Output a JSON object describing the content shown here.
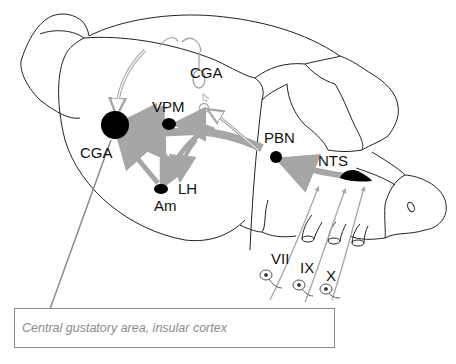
{
  "diagram": {
    "labels": {
      "cga_top": "CGA",
      "cga_main": "CGA",
      "vpm": "VPM",
      "pbn": "PBN",
      "nts": "NTS",
      "lh": "LH",
      "am": "Am",
      "nerve_vii": "VII",
      "nerve_ix": "IX",
      "nerve_x": "X"
    },
    "caption": "Central gustatory area, insular cortex",
    "colors": {
      "outline": "#222222",
      "pathway": "#a6a6a6",
      "nucleus": "#000000",
      "caption_border": "#8a8a8a",
      "caption_text": "#8a8a8a"
    },
    "pathways": [
      {
        "from": "nerves VII/IX/X",
        "to": "NTS"
      },
      {
        "from": "NTS",
        "to": "PBN"
      },
      {
        "from": "PBN",
        "to": "VPM"
      },
      {
        "from": "PBN",
        "to": "CGA"
      },
      {
        "from": "PBN",
        "to": "LH"
      },
      {
        "from": "PBN",
        "to": "Am"
      },
      {
        "from": "VPM",
        "to": "CGA"
      },
      {
        "from": "Am",
        "to": "CGA"
      },
      {
        "from": "PBN",
        "to": "CGA (contralateral)"
      }
    ]
  }
}
